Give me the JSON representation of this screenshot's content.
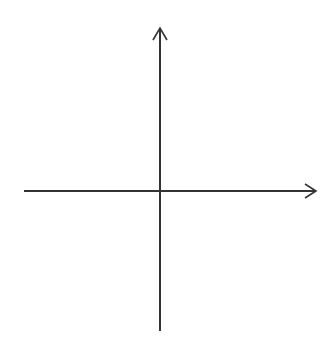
{
  "diagram": {
    "type": "coordinate-plane",
    "x_axis": {
      "label": "x",
      "ticks": [
        "−5",
        "−4",
        "−3",
        "−2",
        "−1",
        "1",
        "2",
        "3",
        "4",
        "5"
      ]
    },
    "y_axis": {
      "label": "y",
      "ticks": [
        "5",
        "4",
        "3",
        "2",
        "1",
        "−1",
        "−2",
        "−3",
        "−4",
        "−5"
      ]
    },
    "grid": {
      "x_range": [
        -7,
        6
      ],
      "y_range": [
        -6,
        6
      ],
      "style": "dotted"
    },
    "colors": {
      "axis": "#333333",
      "grid": "#9a9a9a"
    }
  }
}
